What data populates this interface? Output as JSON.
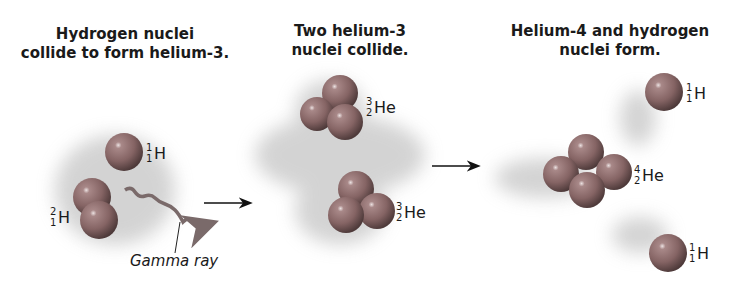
{
  "stages": [
    {
      "title_line1": "Hydrogen nuclei",
      "title_line2": "collide to form helium-3."
    },
    {
      "title_line1": "Two helium-3",
      "title_line2": "nuclei collide."
    },
    {
      "title_line1": "Helium-4 and hydrogen",
      "title_line2": "nuclei form."
    }
  ],
  "labels": {
    "h1_a": {
      "mass": "1",
      "atomic": "1",
      "symbol": "H"
    },
    "h2": {
      "mass": "2",
      "atomic": "1",
      "symbol": "H"
    },
    "he3_a": {
      "mass": "3",
      "atomic": "2",
      "symbol": "He"
    },
    "he3_b": {
      "mass": "3",
      "atomic": "2",
      "symbol": "He"
    },
    "he4": {
      "mass": "4",
      "atomic": "2",
      "symbol": "He"
    },
    "h1_b": {
      "mass": "1",
      "atomic": "1",
      "symbol": "H"
    },
    "h1_c": {
      "mass": "1",
      "atomic": "1",
      "symbol": "H"
    },
    "gamma": "Gamma ray"
  },
  "colors": {
    "sphere": "#8c6a6a",
    "sphere_dark": "#5a4242",
    "highlight": "#e8dede",
    "text": "#1a1a1a",
    "gamma": "#7a6a6a"
  }
}
